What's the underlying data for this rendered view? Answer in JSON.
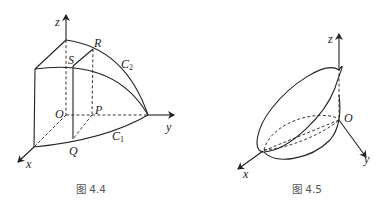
{
  "figures": [
    {
      "id": "fig-4-4",
      "caption": "图 4.4",
      "axes": {
        "x": "x",
        "y": "y",
        "z": "z"
      },
      "points": {
        "origin": "O",
        "P": "P",
        "Q": "Q",
        "R": "R",
        "S": "S"
      },
      "curves": {
        "C1": {
          "main": "C",
          "sub": "1"
        },
        "C2": {
          "main": "C",
          "sub": "2"
        }
      }
    },
    {
      "id": "fig-4-5",
      "caption": "图 4.5",
      "axes": {
        "x": "x",
        "y": "y",
        "z": "z"
      },
      "points": {
        "origin": "O"
      }
    }
  ]
}
